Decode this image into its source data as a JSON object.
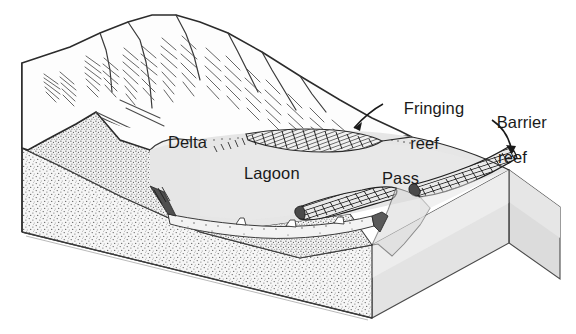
{
  "diagram": {
    "labels": {
      "delta": "Delta",
      "lagoon": "Lagoon",
      "pass": "Pass",
      "fringing_reef_line1": "Fringing",
      "fringing_reef_line2": "reef",
      "barrier_reef_line1": "Barrier",
      "barrier_reef_line2": "reef"
    },
    "colors": {
      "ink": "#1a1a1a",
      "outline": "#2b2b2b",
      "lagoon_fill": "#e6e6e6",
      "shelf_fill": "#e2e2e2",
      "block_front_light": "#ededed",
      "block_front_dark": "#d9d9d9",
      "block_side": "#e4e4e4",
      "sediment_fill": "#f4f4f4",
      "reef_fill": "#7a7a7a",
      "reef_dark": "#3d3d3d",
      "background": "#ffffff"
    },
    "features": [
      {
        "name": "mountain",
        "description": "hachured volcanic peak ridge"
      },
      {
        "name": "delta",
        "description": "alluvial delta at river mouth into lagoon"
      },
      {
        "name": "lagoon",
        "description": "shallow water body between shore and barrier reef"
      },
      {
        "name": "fringing-reef",
        "description": "hatched reef band attached to shoreline"
      },
      {
        "name": "barrier-reef",
        "description": "hatched reef band offshore along shelf edge"
      },
      {
        "name": "pass",
        "description": "gap/channel through the reef"
      },
      {
        "name": "sediment-wedge",
        "description": "stippled sediment on cut block face"
      },
      {
        "name": "ocean-block",
        "description": "cut-away block showing water and substrate"
      }
    ]
  }
}
